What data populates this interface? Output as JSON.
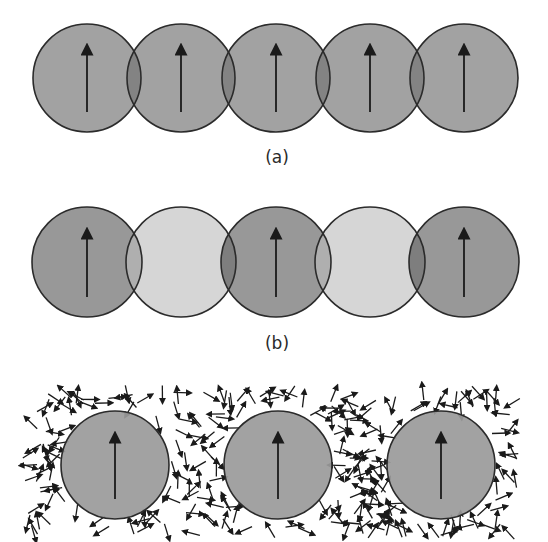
{
  "figure": {
    "panels": [
      {
        "id": "a",
        "label": "(a)",
        "label_pos": [
          277,
          163
        ],
        "radius": 54,
        "cy": 78,
        "arrow": {
          "y_top": 44,
          "y_bottom": 112
        },
        "circles": [
          {
            "cx": 87,
            "fill": "#9a9a9a",
            "spin": "up"
          },
          {
            "cx": 181,
            "fill": "#9a9a9a",
            "spin": "up"
          },
          {
            "cx": 276,
            "fill": "#9a9a9a",
            "spin": "up"
          },
          {
            "cx": 370,
            "fill": "#9a9a9a",
            "spin": "up"
          },
          {
            "cx": 464,
            "fill": "#9a9a9a",
            "spin": "up"
          }
        ]
      },
      {
        "id": "b",
        "label": "(b)",
        "label_pos": [
          277,
          349
        ],
        "radius": 55,
        "cy": 262,
        "arrow": {
          "y_top": 228,
          "y_bottom": 297
        },
        "circles": [
          {
            "cx": 87,
            "fill": "#8f8f8f",
            "spin": "up"
          },
          {
            "cx": 181,
            "fill": "#d2d2d2",
            "spin": "none"
          },
          {
            "cx": 276,
            "fill": "#8f8f8f",
            "spin": "up"
          },
          {
            "cx": 370,
            "fill": "#d2d2d2",
            "spin": "none"
          },
          {
            "cx": 464,
            "fill": "#8f8f8f",
            "spin": "up"
          }
        ]
      },
      {
        "id": "c",
        "label": "",
        "radius": 54,
        "cy": 465,
        "arrow": {
          "y_top": 432,
          "y_bottom": 499
        },
        "circles": [
          {
            "cx": 115,
            "fill": "#9a9a9a",
            "spin": "up"
          },
          {
            "cx": 278,
            "fill": "#9a9a9a",
            "spin": "up"
          },
          {
            "cx": 441,
            "fill": "#9a9a9a",
            "spin": "up"
          }
        ],
        "random_spin_field": {
          "x0": 28,
          "x1": 516,
          "y0": 392,
          "y1": 534,
          "count": 260,
          "arrow_len": 16,
          "seed": 7
        }
      }
    ],
    "colors": {
      "outline": "#2b2b2b",
      "arrow": "#1a1a1a",
      "background": "#ffffff"
    }
  }
}
